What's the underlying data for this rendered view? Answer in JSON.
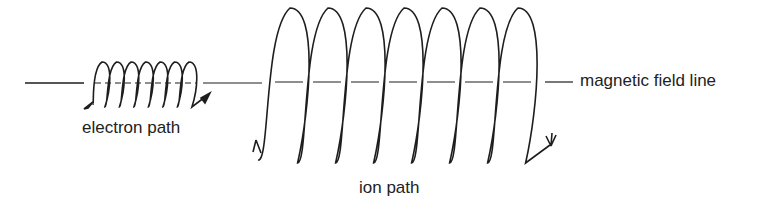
{
  "labels": {
    "electron": "electron path",
    "ion": "ion path",
    "field": "magnetic field line"
  },
  "colors": {
    "stroke": "#1e1e1e",
    "text": "#222222"
  },
  "diagram": {
    "electron_loops": 7,
    "ion_loops": 7
  }
}
